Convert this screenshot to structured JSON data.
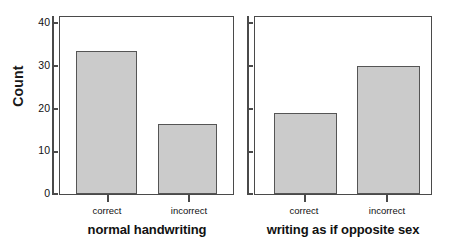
{
  "chart_data": {
    "type": "bar",
    "title": "",
    "subtitle": "",
    "xlabel": "",
    "ylabel": "Count",
    "ylim": [
      0,
      42
    ],
    "yticks": [
      0,
      10,
      20,
      30,
      40
    ],
    "ytick_labels": [
      "0",
      "10",
      "20",
      "30",
      "40"
    ],
    "grid": false,
    "legend": "none",
    "categories": [
      "correct",
      "incorrect"
    ],
    "panels": [
      {
        "title": "normal handwriting",
        "categories": [
          "correct",
          "incorrect"
        ],
        "values": [
          33,
          16
        ]
      },
      {
        "title": "writing as if opposite sex",
        "categories": [
          "correct",
          "incorrect"
        ],
        "values": [
          18.5,
          29.5
        ]
      }
    ],
    "bar_fill_color": "#cbcbcb",
    "bar_edge_color": "#555555",
    "axis_color": "#4a4a4a"
  }
}
